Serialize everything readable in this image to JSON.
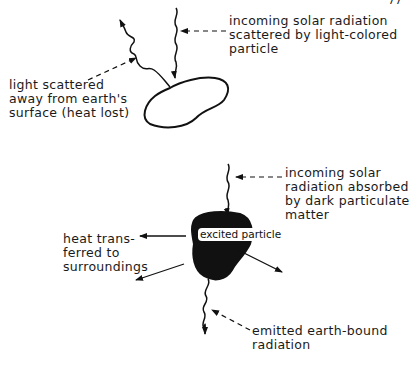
{
  "page_number": "77",
  "top_diagram": {
    "particle_type": "light-colored particle",
    "labels": {
      "incoming": "incoming solar radiation\nscattered by light-colored\nparticle",
      "scattered": "light scattered\naway from earth's\nsurface (heat lost)"
    }
  },
  "bottom_diagram": {
    "particle_label": "excited\nparticle",
    "labels": {
      "incoming": "incoming solar\nradiation absorbed\nby dark particulate\nmatter",
      "heat": "heat trans-\nferred to\nsurroundings",
      "emitted": "emitted earth-bound\nradiation"
    }
  },
  "colors": {
    "ink": "#111111",
    "background": "#ffffff"
  }
}
